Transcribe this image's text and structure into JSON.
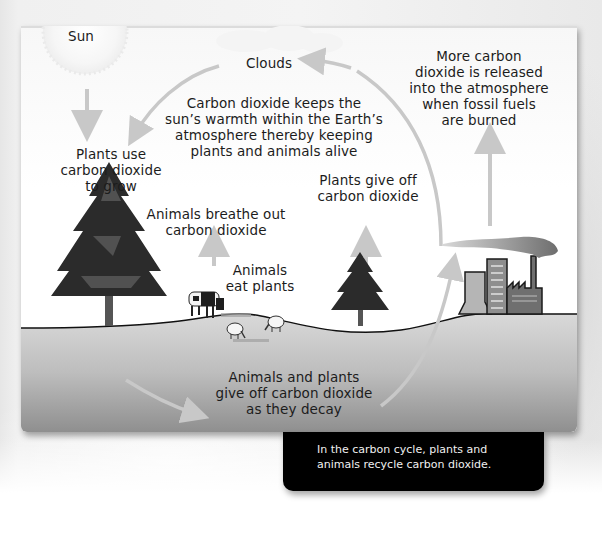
{
  "diagram": {
    "title": "Carbon cycle",
    "labels": {
      "sun": "Sun",
      "clouds": "Clouds",
      "greenhouse": [
        "Carbon dioxide keeps the",
        "sun’s warmth within the Earth’s",
        "atmosphere thereby keeping",
        "plants and animals alive"
      ],
      "fossil_fuels": [
        "More carbon",
        "dioxide is released",
        "into the atmosphere",
        "when fossil fuels",
        "are burned"
      ],
      "plants_use": [
        "Plants use",
        "carbon dioxide",
        "to grow"
      ],
      "plants_give_off": [
        "Plants give off",
        "carbon dioxide"
      ],
      "animals_breathe": [
        "Animals breathe out",
        "carbon dioxide"
      ],
      "animals_eat": [
        "Animals",
        "eat plants"
      ],
      "decay": [
        "Animals and plants",
        "give off carbon dioxide",
        "as they decay"
      ]
    },
    "elements": [
      "sun",
      "clouds",
      "large-pine-tree",
      "small-pine-tree",
      "cow",
      "sheep",
      "sheep",
      "factory",
      "smoke-plume",
      "cycle-arrows",
      "ground"
    ],
    "colors": {
      "arrow": "#c8c8c8",
      "ground_top": "#d6d6d6",
      "ground_bottom": "#9a9a9a",
      "caption_bg": "#000000",
      "caption_text": "#f0f0f0",
      "text": "#1c1c1c"
    }
  },
  "caption": {
    "line1": "In the carbon cycle, plants and",
    "line2": "animals recycle carbon dioxide."
  }
}
